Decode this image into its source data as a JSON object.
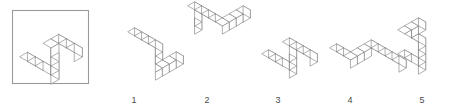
{
  "page": {
    "kind": "mental-rotation-test-item",
    "background_color": "#ffffff",
    "line_color": "#7b7b7b",
    "frame_color": "#9a9a9a",
    "label_color": "#4a4a4a",
    "width": 464,
    "height": 109
  },
  "reference": {
    "name": "reference-figure",
    "framed": true,
    "frame": {
      "x": 12,
      "y": 10,
      "width": 76,
      "height": 73
    },
    "description": "Isometric wireframe polycube: an L/Z shaped chain of unit cubes, one arm running down-right to the lower left and one arm rising then turning right at the top.",
    "cube_count": 10,
    "origin": {
      "x": 20,
      "y": 66
    },
    "cell": 9,
    "cubes": [
      [
        0,
        0,
        0
      ],
      [
        1,
        0,
        0
      ],
      [
        2,
        0,
        0
      ],
      [
        3,
        0,
        0
      ],
      [
        3,
        0,
        1
      ],
      [
        3,
        0,
        2
      ],
      [
        3,
        0,
        3
      ],
      [
        3,
        1,
        3
      ],
      [
        4,
        1,
        3
      ],
      [
        5,
        1,
        3
      ]
    ]
  },
  "options": [
    {
      "label": "1",
      "name": "option-1",
      "label_x": 134,
      "label_y": 103,
      "origin": {
        "x": 128,
        "y": 40
      },
      "cell": 8,
      "cubes": [
        [
          0,
          0,
          0
        ],
        [
          1,
          0,
          0
        ],
        [
          2,
          0,
          0
        ],
        [
          3,
          0,
          0
        ],
        [
          3,
          0,
          -1
        ],
        [
          3,
          0,
          -2
        ],
        [
          3,
          0,
          -3
        ],
        [
          3,
          1,
          -3
        ],
        [
          3,
          2,
          -3
        ],
        [
          3,
          3,
          -3
        ]
      ]
    },
    {
      "label": "2",
      "name": "option-2",
      "label_x": 207,
      "label_y": 103,
      "origin": {
        "x": 188,
        "y": 30
      },
      "cell": 8,
      "cubes": [
        [
          0,
          0,
          0
        ],
        [
          0,
          0,
          1
        ],
        [
          0,
          0,
          2
        ],
        [
          1,
          0,
          2
        ],
        [
          2,
          0,
          2
        ],
        [
          3,
          0,
          2
        ],
        [
          4,
          0,
          2
        ],
        [
          4,
          1,
          2
        ],
        [
          4,
          2,
          2
        ],
        [
          4,
          3,
          2
        ]
      ]
    },
    {
      "label": "3",
      "name": "option-3",
      "label_x": 278,
      "label_y": 103,
      "origin": {
        "x": 262,
        "y": 62
      },
      "cell": 8,
      "cubes": [
        [
          0,
          0,
          0
        ],
        [
          1,
          0,
          0
        ],
        [
          2,
          0,
          0
        ],
        [
          3,
          0,
          0
        ],
        [
          3,
          0,
          1
        ],
        [
          3,
          0,
          2
        ],
        [
          3,
          0,
          3
        ],
        [
          4,
          0,
          3
        ],
        [
          5,
          0,
          3
        ],
        [
          6,
          0,
          3
        ]
      ]
    },
    {
      "label": "4",
      "name": "option-4",
      "label_x": 350,
      "label_y": 103,
      "origin": {
        "x": 330,
        "y": 56
      },
      "cell": 8,
      "cubes": [
        [
          0,
          0,
          0
        ],
        [
          1,
          0,
          0
        ],
        [
          2,
          0,
          0
        ],
        [
          2,
          1,
          0
        ],
        [
          2,
          2,
          0
        ],
        [
          2,
          3,
          0
        ],
        [
          3,
          3,
          0
        ],
        [
          4,
          3,
          0
        ],
        [
          5,
          3,
          0
        ],
        [
          6,
          3,
          0
        ]
      ]
    },
    {
      "label": "5",
      "name": "option-5",
      "label_x": 422,
      "label_y": 103,
      "origin": {
        "x": 398,
        "y": 62
      },
      "cell": 8,
      "cubes": [
        [
          0,
          0,
          0
        ],
        [
          1,
          0,
          0
        ],
        [
          2,
          0,
          0
        ],
        [
          2,
          0,
          1
        ],
        [
          2,
          0,
          2
        ],
        [
          2,
          0,
          3
        ],
        [
          1,
          0,
          3
        ],
        [
          0,
          0,
          3
        ],
        [
          0,
          1,
          3
        ],
        [
          0,
          2,
          3
        ]
      ]
    }
  ]
}
